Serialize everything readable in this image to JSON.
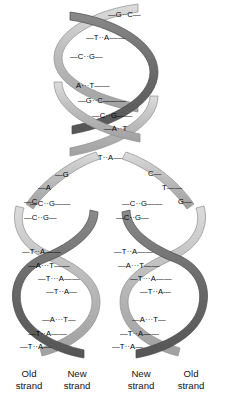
{
  "figure": {
    "colors": {
      "background": "#ffffff",
      "ribbon_light": "#b9b9b9",
      "ribbon_light_edge": "#8e8e8e",
      "ribbon_dark": "#6e6e6e",
      "ribbon_dark_edge": "#4a4a4a",
      "ribbon_highlight": "#d8d8d8",
      "text": "#000000",
      "bond": "#333333"
    },
    "bond_symbol": "···",
    "rung_symbol": "—"
  },
  "parent_duplex": {
    "name": "unreplicated parent helix",
    "base_pairs": [
      {
        "left": "G",
        "right": "C"
      },
      {
        "left": "T",
        "right": "A"
      },
      {
        "left": "C",
        "right": "G"
      },
      {
        "left": "A",
        "right": "T"
      },
      {
        "left": "G",
        "right": "C"
      },
      {
        "left": "C",
        "right": "G"
      },
      {
        "left": "A",
        "right": "T"
      },
      {
        "left": "T",
        "right": "A"
      }
    ]
  },
  "fork": {
    "name": "replication fork unpaired bases",
    "left_template_bases": [
      "G",
      "A",
      "C"
    ],
    "right_template_bases": [
      "C",
      "T",
      "G"
    ]
  },
  "left_daughter": {
    "name": "left daughter duplex",
    "base_pairs": [
      {
        "left": "C",
        "right": "G"
      },
      {
        "left": "C",
        "right": "G"
      },
      {
        "left": "T",
        "right": "A"
      },
      {
        "left": "A",
        "right": "T"
      },
      {
        "left": "T",
        "right": "A"
      },
      {
        "left": "T",
        "right": "A"
      },
      {
        "left": "A",
        "right": "T"
      },
      {
        "left": "T",
        "right": "A"
      },
      {
        "left": "T",
        "right": "A"
      }
    ],
    "labels": {
      "outer": "Old",
      "outer_sub": "strand",
      "inner": "New",
      "inner_sub": "strand"
    }
  },
  "right_daughter": {
    "name": "right daughter duplex",
    "base_pairs": [
      {
        "left": "C",
        "right": "G"
      },
      {
        "left": "C",
        "right": "G"
      },
      {
        "left": "T",
        "right": "A"
      },
      {
        "left": "A",
        "right": "T"
      },
      {
        "left": "T",
        "right": "A"
      },
      {
        "left": "T",
        "right": "A"
      },
      {
        "left": "A",
        "right": "T"
      },
      {
        "left": "T",
        "right": "A"
      },
      {
        "left": "T",
        "right": "A"
      }
    ],
    "labels": {
      "inner": "New",
      "inner_sub": "strand",
      "outer": "Old",
      "outer_sub": "strand"
    }
  },
  "captions": [
    {
      "id": "old-left",
      "line1": "Old",
      "line2": "strand"
    },
    {
      "id": "new-left",
      "line1": "New",
      "line2": "strand"
    },
    {
      "id": "new-right",
      "line1": "New",
      "line2": "strand"
    },
    {
      "id": "old-right",
      "line1": "Old",
      "line2": "strand"
    }
  ]
}
